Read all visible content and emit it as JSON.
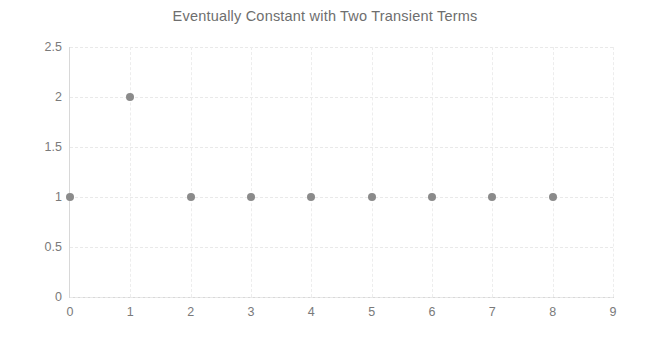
{
  "chart_data": {
    "type": "scatter",
    "title": "Eventually Constant with Two Transient Terms",
    "xlabel": "",
    "ylabel": "",
    "x": [
      0,
      1,
      2,
      3,
      4,
      5,
      6,
      7,
      8
    ],
    "values": [
      1,
      2,
      1,
      1,
      1,
      1,
      1,
      1,
      1
    ],
    "series": [
      {
        "name": "sequence",
        "x": [
          0,
          1,
          2,
          3,
          4,
          5,
          6,
          7,
          8
        ],
        "values": [
          1,
          2,
          1,
          1,
          1,
          1,
          1,
          1,
          1
        ]
      }
    ],
    "xlim": [
      0,
      9
    ],
    "ylim": [
      0,
      2.5
    ],
    "xticks": [
      0,
      1,
      2,
      3,
      4,
      5,
      6,
      7,
      8,
      9
    ],
    "xtick_labels": [
      "0",
      "1",
      "2",
      "3",
      "4",
      "5",
      "6",
      "7",
      "8",
      "9"
    ],
    "yticks": [
      0,
      0.5,
      1,
      1.5,
      2,
      2.5
    ],
    "ytick_labels": [
      "0",
      "0.5",
      "1",
      "1.5",
      "2",
      "2.5"
    ],
    "grid": true,
    "legend": false,
    "marker_color": "#8b8b8b",
    "grid_color": "#e9e9e9",
    "axis_color": "#d8d8d8",
    "title_color": "#6e6e6e",
    "tick_color": "#7a7a7a",
    "background": "#ffffff"
  }
}
